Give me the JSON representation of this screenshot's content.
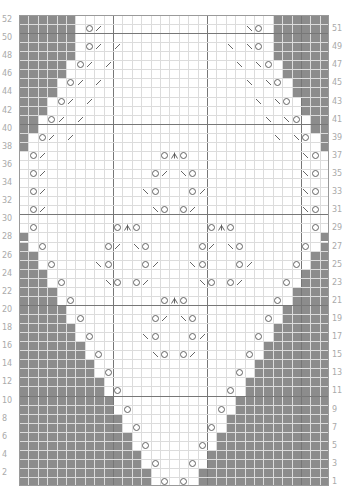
{
  "chart_meta": {
    "type": "knitting-lace-chart",
    "columns": 33,
    "rows": 52,
    "cell_width_px": 9.4,
    "cell_height_px": 9.06,
    "heavy_line_every": 10,
    "colors": {
      "no_stitch_gray": "#8c8c8c",
      "grid_line": "#dcdcdc",
      "heavy_line": "#777777",
      "symbol": "#555555",
      "label": "#aaaaaa",
      "background": "#ffffff"
    }
  },
  "legend_symbols": {
    "O": "yarn-over",
    "/": "k2tog (right-leaning decrease)",
    "\\": "ssk (left-leaning decrease)",
    "A": "centered double decrease"
  },
  "row_labels": {
    "left_even": [
      "52",
      "50",
      "48",
      "46",
      "44",
      "42",
      "40",
      "38",
      "36",
      "34",
      "32",
      "30",
      "28",
      "26",
      "24",
      "22",
      "20",
      "18",
      "16",
      "14",
      "12",
      "10",
      "8",
      "6",
      "4",
      "2"
    ],
    "right_odd": [
      "51",
      "49",
      "47",
      "45",
      "43",
      "41",
      "39",
      "37",
      "35",
      "33",
      "31",
      "29",
      "27",
      "25",
      "23",
      "21",
      "19",
      "17",
      "15",
      "13",
      "11",
      "9",
      "7",
      "5",
      "3",
      "1"
    ]
  },
  "gray_left_count": {
    "52": 6,
    "51": 6,
    "50": 6,
    "49": 6,
    "48": 6,
    "47": 5,
    "46": 5,
    "45": 4,
    "44": 4,
    "43": 3,
    "42": 3,
    "41": 2,
    "40": 2,
    "39": 1,
    "38": 1,
    "37": 0,
    "36": 0,
    "35": 0,
    "34": 0,
    "33": 0,
    "32": 0,
    "31": 0,
    "30": 0,
    "29": 0,
    "28": 1,
    "27": 1,
    "26": 2,
    "25": 2,
    "24": 3,
    "23": 3,
    "22": 4,
    "21": 4,
    "20": 5,
    "19": 5,
    "18": 6,
    "17": 6,
    "16": 7,
    "15": 7,
    "14": 8,
    "13": 8,
    "12": 9,
    "11": 9,
    "10": 10,
    "9": 10,
    "8": 11,
    "7": 11,
    "6": 12,
    "5": 12,
    "4": 13,
    "3": 13,
    "2": 14,
    "1": 14
  },
  "stitches": {
    "51": [
      [
        8,
        "O"
      ],
      [
        9,
        "/"
      ],
      [
        25,
        "\\"
      ],
      [
        26,
        "O"
      ]
    ],
    "49": [
      [
        8,
        "O"
      ],
      [
        9,
        "/"
      ],
      [
        11,
        "/"
      ],
      [
        23,
        "\\"
      ],
      [
        25,
        "\\"
      ],
      [
        26,
        "O"
      ]
    ],
    "47": [
      [
        7,
        "O"
      ],
      [
        8,
        "/"
      ],
      [
        10,
        "/"
      ],
      [
        24,
        "\\"
      ],
      [
        26,
        "\\"
      ],
      [
        27,
        "O"
      ]
    ],
    "45": [
      [
        6,
        "O"
      ],
      [
        7,
        "/"
      ],
      [
        9,
        "/"
      ],
      [
        25,
        "\\"
      ],
      [
        27,
        "\\"
      ],
      [
        28,
        "O"
      ]
    ],
    "43": [
      [
        5,
        "O"
      ],
      [
        6,
        "/"
      ],
      [
        8,
        "/"
      ],
      [
        26,
        "\\"
      ],
      [
        28,
        "\\"
      ],
      [
        29,
        "O"
      ]
    ],
    "41": [
      [
        4,
        "O"
      ],
      [
        5,
        "/"
      ],
      [
        7,
        "/"
      ],
      [
        27,
        "\\"
      ],
      [
        29,
        "\\"
      ],
      [
        30,
        "O"
      ]
    ],
    "39": [
      [
        3,
        "O"
      ],
      [
        4,
        "/"
      ],
      [
        6,
        "/"
      ],
      [
        28,
        "\\"
      ],
      [
        30,
        "\\"
      ],
      [
        31,
        "O"
      ]
    ],
    "37": [
      [
        2,
        "O"
      ],
      [
        3,
        "/"
      ],
      [
        16,
        "O"
      ],
      [
        17,
        "A"
      ],
      [
        18,
        "O"
      ],
      [
        31,
        "\\"
      ],
      [
        32,
        "O"
      ]
    ],
    "35": [
      [
        2,
        "O"
      ],
      [
        3,
        "/"
      ],
      [
        15,
        "O"
      ],
      [
        16,
        "/"
      ],
      [
        18,
        "\\"
      ],
      [
        19,
        "O"
      ],
      [
        31,
        "\\"
      ],
      [
        32,
        "O"
      ]
    ],
    "33": [
      [
        2,
        "O"
      ],
      [
        3,
        "/"
      ],
      [
        14,
        "\\"
      ],
      [
        15,
        "O"
      ],
      [
        19,
        "O"
      ],
      [
        20,
        "/"
      ],
      [
        31,
        "\\"
      ],
      [
        32,
        "O"
      ]
    ],
    "31": [
      [
        2,
        "O"
      ],
      [
        3,
        "/"
      ],
      [
        15,
        "\\"
      ],
      [
        16,
        "O"
      ],
      [
        18,
        "O"
      ],
      [
        19,
        "/"
      ],
      [
        31,
        "\\"
      ],
      [
        32,
        "O"
      ]
    ],
    "29": [
      [
        2,
        "O"
      ],
      [
        11,
        "O"
      ],
      [
        12,
        "A"
      ],
      [
        13,
        "O"
      ],
      [
        21,
        "O"
      ],
      [
        22,
        "A"
      ],
      [
        23,
        "O"
      ],
      [
        32,
        "O"
      ]
    ],
    "27": [
      [
        3,
        "O"
      ],
      [
        10,
        "O"
      ],
      [
        11,
        "/"
      ],
      [
        13,
        "\\"
      ],
      [
        14,
        "O"
      ],
      [
        20,
        "O"
      ],
      [
        21,
        "/"
      ],
      [
        23,
        "\\"
      ],
      [
        24,
        "O"
      ],
      [
        31,
        "O"
      ]
    ],
    "25": [
      [
        4,
        "O"
      ],
      [
        9,
        "\\"
      ],
      [
        10,
        "O"
      ],
      [
        14,
        "O"
      ],
      [
        15,
        "/"
      ],
      [
        19,
        "\\"
      ],
      [
        20,
        "O"
      ],
      [
        24,
        "O"
      ],
      [
        25,
        "/"
      ],
      [
        30,
        "O"
      ]
    ],
    "23": [
      [
        5,
        "O"
      ],
      [
        10,
        "\\"
      ],
      [
        11,
        "O"
      ],
      [
        13,
        "O"
      ],
      [
        14,
        "/"
      ],
      [
        20,
        "\\"
      ],
      [
        21,
        "O"
      ],
      [
        23,
        "O"
      ],
      [
        24,
        "/"
      ],
      [
        29,
        "O"
      ]
    ],
    "21": [
      [
        6,
        "O"
      ],
      [
        16,
        "O"
      ],
      [
        17,
        "A"
      ],
      [
        18,
        "O"
      ],
      [
        28,
        "O"
      ]
    ],
    "19": [
      [
        7,
        "O"
      ],
      [
        15,
        "O"
      ],
      [
        16,
        "/"
      ],
      [
        18,
        "\\"
      ],
      [
        19,
        "O"
      ],
      [
        27,
        "O"
      ]
    ],
    "17": [
      [
        8,
        "O"
      ],
      [
        14,
        "\\"
      ],
      [
        15,
        "O"
      ],
      [
        19,
        "O"
      ],
      [
        20,
        "/"
      ],
      [
        26,
        "O"
      ]
    ],
    "15": [
      [
        9,
        "O"
      ],
      [
        15,
        "\\"
      ],
      [
        16,
        "O"
      ],
      [
        18,
        "O"
      ],
      [
        19,
        "/"
      ],
      [
        25,
        "O"
      ]
    ],
    "13": [
      [
        10,
        "O"
      ],
      [
        24,
        "O"
      ]
    ],
    "11": [
      [
        11,
        "O"
      ],
      [
        23,
        "O"
      ]
    ],
    "9": [
      [
        12,
        "O"
      ],
      [
        22,
        "O"
      ]
    ],
    "7": [
      [
        13,
        "O"
      ],
      [
        21,
        "O"
      ]
    ],
    "5": [
      [
        14,
        "O"
      ],
      [
        20,
        "O"
      ]
    ],
    "3": [
      [
        15,
        "O"
      ],
      [
        19,
        "O"
      ]
    ],
    "1": [
      [
        16,
        "O"
      ],
      [
        18,
        "O"
      ]
    ]
  }
}
